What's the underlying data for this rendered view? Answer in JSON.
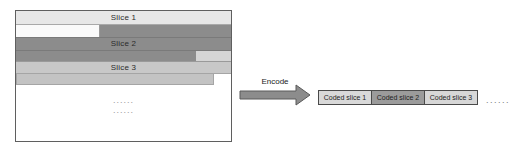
{
  "figure": {
    "frame": {
      "rows": [
        {
          "kind": "slice-header",
          "label": "Slice 1"
        },
        {
          "kind": "partial-row"
        },
        {
          "kind": "slice-header",
          "label": "Slice 2"
        },
        {
          "kind": "partial-row"
        },
        {
          "kind": "slice-header",
          "label": "Slice 3"
        },
        {
          "kind": "partial-row"
        }
      ],
      "ellipsis_line1": "......",
      "ellipsis_line2": "......"
    },
    "encode_label": "Encode",
    "coded_slices": [
      {
        "label": "Coded slice 1"
      },
      {
        "label": "Coded slice 2"
      },
      {
        "label": "Coded slice 3"
      }
    ],
    "trailing_ellipsis": "......"
  },
  "colors": {
    "slice1_fill": "#e7e7e7",
    "dark_slice_fill": "#8c8c8c",
    "medium_slice_fill": "#c8c8c8",
    "partial_light_fill": "#d5d5d5",
    "partial_white_fill": "#fafafa",
    "coded_light_fill": "#d9d9d9",
    "coded_dark_fill": "#9b9b9b",
    "arrow_fill": "#8c8c8c",
    "border_dark": "#4a4a4a",
    "frame_border": "#5f5f5f"
  }
}
